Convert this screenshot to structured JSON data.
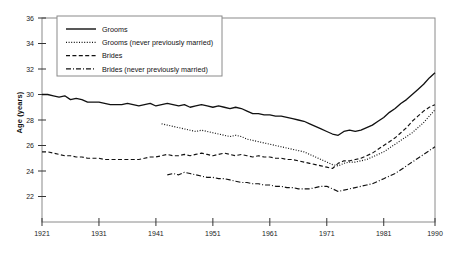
{
  "chart_data": {
    "type": "line",
    "title": "",
    "xlabel": "",
    "ylabel": "Age (years)",
    "xlim": [
      1921,
      1990
    ],
    "ylim": [
      20,
      36
    ],
    "xticks": [
      1921,
      1931,
      1941,
      1951,
      1961,
      1971,
      1981,
      1990
    ],
    "yticks": [
      22,
      24,
      26,
      28,
      30,
      32,
      34,
      36
    ],
    "grid": false,
    "legend_position": "top-left",
    "series": [
      {
        "name": "Grooms",
        "style": "solid",
        "color": "#111111",
        "x": [
          1921,
          1922,
          1923,
          1924,
          1925,
          1926,
          1927,
          1928,
          1929,
          1930,
          1931,
          1932,
          1933,
          1934,
          1935,
          1936,
          1937,
          1938,
          1939,
          1940,
          1941,
          1942,
          1943,
          1944,
          1945,
          1946,
          1947,
          1948,
          1949,
          1950,
          1951,
          1952,
          1953,
          1954,
          1955,
          1956,
          1957,
          1958,
          1959,
          1960,
          1961,
          1962,
          1963,
          1964,
          1965,
          1966,
          1967,
          1968,
          1969,
          1970,
          1971,
          1972,
          1973,
          1974,
          1975,
          1976,
          1977,
          1978,
          1979,
          1980,
          1981,
          1982,
          1983,
          1984,
          1985,
          1986,
          1987,
          1988,
          1989,
          1990
        ],
        "y": [
          30.0,
          30.0,
          29.9,
          29.8,
          29.9,
          29.6,
          29.7,
          29.6,
          29.4,
          29.4,
          29.4,
          29.3,
          29.2,
          29.2,
          29.2,
          29.3,
          29.2,
          29.1,
          29.2,
          29.3,
          29.1,
          29.2,
          29.3,
          29.2,
          29.1,
          29.2,
          29.0,
          29.1,
          29.2,
          29.1,
          29.0,
          29.1,
          29.0,
          28.9,
          29.0,
          28.9,
          28.7,
          28.5,
          28.5,
          28.4,
          28.4,
          28.3,
          28.3,
          28.2,
          28.1,
          28.0,
          27.9,
          27.7,
          27.5,
          27.3,
          27.1,
          26.9,
          26.8,
          27.1,
          27.2,
          27.1,
          27.2,
          27.4,
          27.6,
          27.9,
          28.2,
          28.6,
          28.9,
          29.3,
          29.6,
          30.0,
          30.4,
          30.8,
          31.3,
          31.7
        ]
      },
      {
        "name": "Grooms (never previously married)",
        "style": "dotted",
        "color": "#111111",
        "x": [
          1942,
          1943,
          1944,
          1945,
          1946,
          1947,
          1948,
          1949,
          1950,
          1951,
          1952,
          1953,
          1954,
          1955,
          1956,
          1957,
          1958,
          1959,
          1960,
          1961,
          1962,
          1963,
          1964,
          1965,
          1966,
          1967,
          1968,
          1969,
          1970,
          1971,
          1972,
          1973,
          1974,
          1975,
          1976,
          1977,
          1978,
          1979,
          1980,
          1981,
          1982,
          1983,
          1984,
          1985,
          1986,
          1987,
          1988,
          1989,
          1990
        ],
        "y": [
          27.7,
          27.6,
          27.5,
          27.4,
          27.3,
          27.2,
          27.1,
          27.2,
          27.1,
          27.0,
          26.9,
          26.8,
          26.7,
          26.8,
          26.7,
          26.5,
          26.4,
          26.3,
          26.2,
          26.1,
          26.0,
          25.9,
          25.8,
          25.7,
          25.6,
          25.5,
          25.3,
          25.1,
          24.9,
          24.7,
          24.5,
          24.4,
          24.6,
          24.7,
          24.7,
          24.8,
          24.9,
          25.1,
          25.3,
          25.5,
          25.8,
          26.1,
          26.4,
          26.7,
          27.0,
          27.4,
          27.8,
          28.3,
          28.8
        ]
      },
      {
        "name": "Brides",
        "style": "dashed",
        "color": "#111111",
        "x": [
          1921,
          1922,
          1923,
          1924,
          1925,
          1926,
          1927,
          1928,
          1929,
          1930,
          1931,
          1932,
          1933,
          1934,
          1935,
          1936,
          1937,
          1938,
          1939,
          1940,
          1941,
          1942,
          1943,
          1944,
          1945,
          1946,
          1947,
          1948,
          1949,
          1950,
          1951,
          1952,
          1953,
          1954,
          1955,
          1956,
          1957,
          1958,
          1959,
          1960,
          1961,
          1962,
          1963,
          1964,
          1965,
          1966,
          1967,
          1968,
          1969,
          1970,
          1971,
          1972,
          1973,
          1974,
          1975,
          1976,
          1977,
          1978,
          1979,
          1980,
          1981,
          1982,
          1983,
          1984,
          1985,
          1986,
          1987,
          1988,
          1989,
          1990
        ],
        "y": [
          25.5,
          25.5,
          25.4,
          25.3,
          25.2,
          25.2,
          25.1,
          25.1,
          25.0,
          25.0,
          25.0,
          24.9,
          24.9,
          24.9,
          24.9,
          24.9,
          24.9,
          24.9,
          25.0,
          25.1,
          25.1,
          25.2,
          25.3,
          25.2,
          25.2,
          25.3,
          25.2,
          25.3,
          25.4,
          25.3,
          25.2,
          25.3,
          25.4,
          25.3,
          25.2,
          25.3,
          25.2,
          25.1,
          25.2,
          25.1,
          25.1,
          25.0,
          25.0,
          24.9,
          24.9,
          24.8,
          24.7,
          24.6,
          24.5,
          24.4,
          24.3,
          24.2,
          24.6,
          24.8,
          24.8,
          24.9,
          25.0,
          25.2,
          25.4,
          25.7,
          26.0,
          26.3,
          26.6,
          27.0,
          27.4,
          27.9,
          28.3,
          28.7,
          29.0,
          29.2
        ]
      },
      {
        "name": "Brides (never previously married)",
        "style": "dashdot",
        "color": "#111111",
        "x": [
          1943,
          1944,
          1945,
          1946,
          1947,
          1948,
          1949,
          1950,
          1951,
          1952,
          1953,
          1954,
          1955,
          1956,
          1957,
          1958,
          1959,
          1960,
          1961,
          1962,
          1963,
          1964,
          1965,
          1966,
          1967,
          1968,
          1969,
          1970,
          1971,
          1972,
          1973,
          1974,
          1975,
          1976,
          1977,
          1978,
          1979,
          1980,
          1981,
          1982,
          1983,
          1984,
          1985,
          1986,
          1987,
          1988,
          1989,
          1990
        ],
        "y": [
          23.7,
          23.8,
          23.7,
          23.9,
          23.8,
          23.7,
          23.6,
          23.5,
          23.5,
          23.4,
          23.4,
          23.3,
          23.2,
          23.1,
          23.1,
          23.0,
          23.0,
          22.9,
          22.9,
          22.8,
          22.8,
          22.7,
          22.7,
          22.6,
          22.6,
          22.6,
          22.7,
          22.8,
          22.8,
          22.6,
          22.4,
          22.5,
          22.6,
          22.7,
          22.8,
          22.9,
          23.0,
          23.2,
          23.4,
          23.6,
          23.8,
          24.1,
          24.4,
          24.7,
          25.0,
          25.3,
          25.6,
          25.9
        ]
      }
    ]
  },
  "axes": {
    "y_axis_label": "Age (years)",
    "y_tick_labels": [
      "22",
      "24",
      "26",
      "28",
      "30",
      "32",
      "34",
      "36"
    ],
    "x_tick_labels": [
      "1921",
      "1931",
      "1941",
      "1951",
      "1961",
      "1971",
      "1981",
      "1990"
    ]
  },
  "legend": {
    "entries": [
      {
        "label": "Grooms",
        "style": "solid"
      },
      {
        "label": "Grooms (never previously married)",
        "style": "dotted"
      },
      {
        "label": "Brides",
        "style": "dashed"
      },
      {
        "label": "Brides (never previously married)",
        "style": "dashdot"
      }
    ]
  }
}
